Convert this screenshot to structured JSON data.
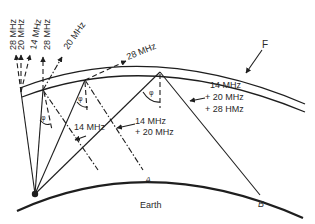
{
  "diagram": {
    "type": "ionospheric-skywave-propagation",
    "labels": {
      "layer": "F",
      "earth": "Earth",
      "point_a": "A",
      "point_b": "B",
      "phi": "φ"
    },
    "escaping_rays": {
      "vertical_28": "28 MHz",
      "vertical_20": "20 MHz",
      "vertical_14": "14 MHz",
      "mid_28": "28 MHz",
      "mid_20": "20 MHz",
      "oblique_28": "28 MHz"
    },
    "reflected_labels": {
      "short_14": "14 MHz",
      "mid_line1": "14 MHz",
      "mid_line2": "+ 20 MHz",
      "long_line1": "14 MHz",
      "long_line2": "+ 20 MHz",
      "long_line3": "+ 28 HMz"
    },
    "colors": {
      "line": "#1e1e1e",
      "text": "#2a2a2a",
      "background": "#ffffff"
    }
  }
}
